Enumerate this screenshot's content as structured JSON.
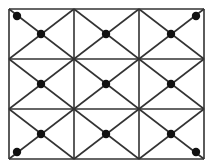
{
  "diagram": {
    "colors": {
      "line": "#333333",
      "dot": "#111111",
      "background": "#ffffff"
    },
    "grid": {
      "x_lines": [
        9,
        74,
        139,
        204
      ],
      "y_lines": [
        9,
        59,
        109,
        159
      ]
    },
    "center_dots": [
      [
        41,
        34
      ],
      [
        106,
        34
      ],
      [
        171,
        34
      ],
      [
        41,
        84
      ],
      [
        106,
        84
      ],
      [
        171,
        84
      ],
      [
        41,
        134
      ],
      [
        106,
        134
      ],
      [
        171,
        134
      ]
    ],
    "corner_dots": [
      [
        17,
        16
      ],
      [
        196,
        16
      ],
      [
        17,
        152
      ],
      [
        196,
        152
      ]
    ]
  }
}
